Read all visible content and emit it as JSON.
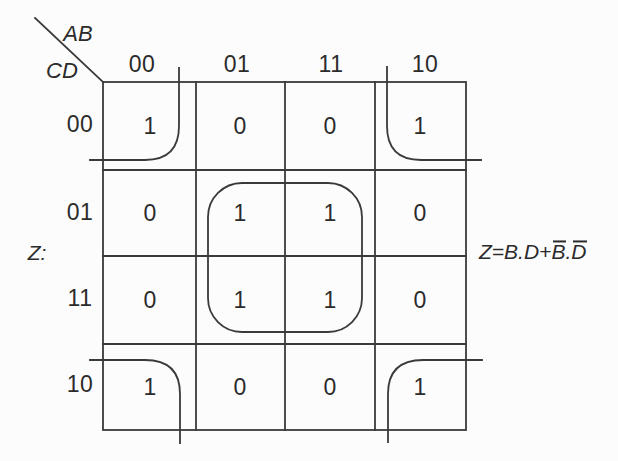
{
  "colors": {
    "ink": "#3a3a3a",
    "text": "#2b2b2b",
    "background": "#fcfcfc"
  },
  "kmap": {
    "col_var": "AB",
    "row_var": "CD",
    "output_label": "Z:",
    "col_labels": [
      "00",
      "01",
      "11",
      "10"
    ],
    "row_labels": [
      "00",
      "01",
      "11",
      "10"
    ],
    "cells": [
      [
        "1",
        "0",
        "0",
        "1"
      ],
      [
        "0",
        "1",
        "1",
        "0"
      ],
      [
        "0",
        "1",
        "1",
        "0"
      ],
      [
        "1",
        "0",
        "0",
        "1"
      ]
    ],
    "equation": {
      "text_full": "Z=B.D+B̄.D̄",
      "seg_head": "Z=B.D+",
      "seg_bar_b": "B",
      "seg_dot": ".",
      "seg_bar_d": "D"
    }
  }
}
